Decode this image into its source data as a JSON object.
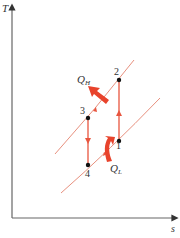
{
  "diagram": {
    "type": "T-s diagram (refrigeration cycle)",
    "axes": {
      "y_label": "T",
      "x_label": "s"
    },
    "heat_labels": {
      "q_h": {
        "main": "Q",
        "sub": "H"
      },
      "q_l": {
        "main": "Q",
        "sub": "L"
      }
    },
    "points": [
      {
        "id": "1",
        "label": "1"
      },
      {
        "id": "2",
        "label": "2"
      },
      {
        "id": "3",
        "label": "3"
      },
      {
        "id": "4",
        "label": "4"
      }
    ],
    "colors": {
      "process": "#e8553f",
      "isobar": "#e89a8a",
      "axis": "#555555",
      "heat_arrow": "#e8432c",
      "point": "#111111"
    }
  }
}
